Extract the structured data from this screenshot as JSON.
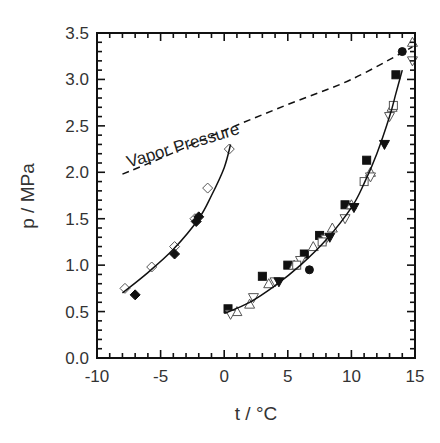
{
  "chart_data": {
    "type": "scatter",
    "title": "",
    "xlabel": "t / °C",
    "ylabel": "p / MPa",
    "xlim": [
      -10,
      15
    ],
    "ylim": [
      0.0,
      3.5
    ],
    "x_ticks": [
      "-10",
      "-5",
      "0",
      "5",
      "10",
      "15"
    ],
    "y_ticks": [
      "0.0",
      "0.5",
      "1.0",
      "1.5",
      "2.0",
      "2.5",
      "3.0",
      "3.5"
    ],
    "grid": false,
    "legend": null,
    "annotations": [
      {
        "text": "Vapor Pressure",
        "x": -7.5,
        "y": 2.05,
        "rotation": -17
      }
    ],
    "series": [
      {
        "name": "Left branch (open diamonds)",
        "marker": "open-diamond",
        "points": [
          [
            -7.8,
            0.75
          ],
          [
            -5.7,
            0.98
          ],
          [
            -3.9,
            1.2
          ],
          [
            -2.3,
            1.5
          ],
          [
            -1.3,
            1.83
          ],
          [
            0.4,
            2.25
          ]
        ]
      },
      {
        "name": "Left branch (filled diamonds)",
        "marker": "filled-diamond",
        "points": [
          [
            -7.0,
            0.68
          ],
          [
            -3.9,
            1.12
          ],
          [
            -2.0,
            1.52
          ],
          [
            -2.2,
            1.47
          ]
        ]
      },
      {
        "name": "Left branch fit",
        "type": "line",
        "points": [
          [
            -8.0,
            0.7
          ],
          [
            -6.0,
            0.92
          ],
          [
            -4.0,
            1.17
          ],
          [
            -2.0,
            1.5
          ],
          [
            -1.0,
            1.75
          ],
          [
            0.0,
            2.05
          ],
          [
            0.5,
            2.3
          ]
        ]
      },
      {
        "name": "Right branch (filled squares)",
        "marker": "filled-square",
        "points": [
          [
            0.3,
            0.53
          ],
          [
            3.0,
            0.88
          ],
          [
            5.0,
            1.0
          ],
          [
            6.3,
            1.12
          ],
          [
            7.5,
            1.32
          ],
          [
            9.5,
            1.65
          ],
          [
            11.2,
            2.13
          ],
          [
            13.5,
            3.05
          ]
        ]
      },
      {
        "name": "Right branch (open triangles)",
        "marker": "open-triangle",
        "points": [
          [
            1.0,
            0.5
          ],
          [
            2.0,
            0.58
          ],
          [
            3.5,
            0.8
          ],
          [
            5.5,
            1.0
          ],
          [
            7.0,
            1.2
          ],
          [
            8.5,
            1.4
          ],
          [
            10.0,
            1.65
          ],
          [
            11.5,
            2.0
          ],
          [
            13.2,
            2.7
          ],
          [
            14.8,
            3.4
          ]
        ]
      },
      {
        "name": "Right branch (open inverted triangles)",
        "marker": "open-triangle-down",
        "points": [
          [
            0.5,
            0.47
          ],
          [
            2.3,
            0.65
          ],
          [
            4.0,
            0.82
          ],
          [
            6.0,
            1.05
          ],
          [
            8.0,
            1.28
          ],
          [
            9.5,
            1.5
          ],
          [
            11.5,
            1.95
          ],
          [
            13.0,
            2.6
          ],
          [
            14.8,
            3.2
          ]
        ]
      },
      {
        "name": "Right branch (filled inverted triangles)",
        "marker": "filled-triangle-down",
        "points": [
          [
            4.3,
            0.82
          ],
          [
            8.3,
            1.3
          ],
          [
            10.2,
            1.62
          ],
          [
            12.6,
            2.3
          ]
        ]
      },
      {
        "name": "Right branch (filled circles)",
        "marker": "filled-circle",
        "points": [
          [
            6.7,
            0.95
          ],
          [
            14.0,
            3.3
          ]
        ]
      },
      {
        "name": "Right branch (open squares)",
        "marker": "open-square",
        "points": [
          [
            5.7,
            1.0
          ],
          [
            7.7,
            1.25
          ],
          [
            11.0,
            1.9
          ],
          [
            13.3,
            2.72
          ]
        ]
      },
      {
        "name": "Right branch fit",
        "type": "line",
        "points": [
          [
            0.0,
            0.48
          ],
          [
            2.0,
            0.6
          ],
          [
            4.0,
            0.78
          ],
          [
            6.0,
            1.0
          ],
          [
            8.0,
            1.27
          ],
          [
            10.0,
            1.62
          ],
          [
            11.0,
            1.88
          ],
          [
            12.0,
            2.2
          ],
          [
            13.0,
            2.6
          ],
          [
            13.5,
            2.85
          ],
          [
            14.0,
            3.1
          ]
        ]
      },
      {
        "name": "Vapor Pressure",
        "type": "dashed-line",
        "points": [
          [
            -8.0,
            1.98
          ],
          [
            -5.0,
            2.15
          ],
          [
            0.0,
            2.45
          ],
          [
            5.0,
            2.73
          ],
          [
            10.0,
            3.0
          ],
          [
            14.8,
            3.35
          ]
        ]
      }
    ]
  }
}
